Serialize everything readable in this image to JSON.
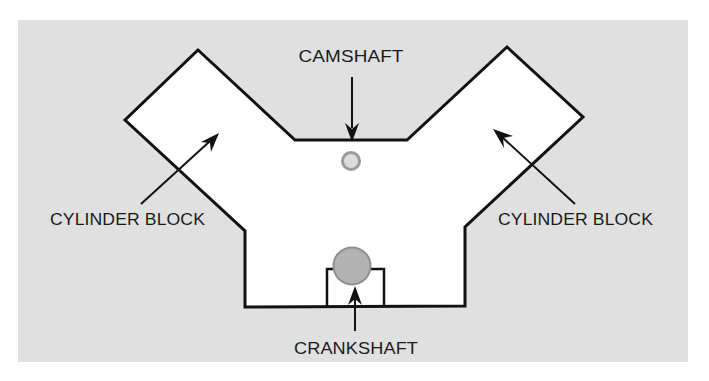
{
  "diagram": {
    "type": "V-engine cross-section",
    "colors": {
      "panel_background": "#e0e0e0",
      "block_fill": "#ffffff",
      "outline": "#111111",
      "camshaft_ring": "#9a9a9a",
      "camshaft_fill": "#dcdcdc",
      "crankshaft_fill": "#b3b3b3",
      "crankshaft_ring": "#8f8f8f"
    },
    "labels": {
      "camshaft": "CAMSHAFT",
      "cylinder_block_left": "CYLINDER BLOCK",
      "cylinder_block_right": "CYLINDER BLOCK",
      "crankshaft": "CRANKSHAFT"
    },
    "components": [
      {
        "name": "cylinder-block-left",
        "label": "CYLINDER BLOCK"
      },
      {
        "name": "cylinder-block-right",
        "label": "CYLINDER BLOCK"
      },
      {
        "name": "camshaft",
        "label": "CAMSHAFT"
      },
      {
        "name": "crankshaft",
        "label": "CRANKSHAFT"
      }
    ]
  }
}
